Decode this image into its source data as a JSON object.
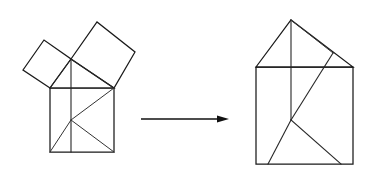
{
  "page": {
    "width": 380,
    "height": 182,
    "background_color": "#ffffff",
    "stroke_color": "#1a1a1a"
  },
  "chart_data": {
    "type": "diagram",
    "subtitle": "Squares on the legs of a right triangle rearranged into the square on the hypotenuse",
    "xlabel": "",
    "ylabel": "",
    "grid": false,
    "legend": "none",
    "xlim": [
      0,
      380
    ],
    "ylim": [
      0,
      182
    ],
    "panels": [
      {
        "name": "left-figure",
        "label": "Right triangle with squares erected on all three sides",
        "shapes": [
          {
            "name": "hypotenuse-square",
            "kind": "square",
            "points": [
              [
                50,
                88
              ],
              [
                114,
                88
              ],
              [
                114,
                152
              ],
              [
                50,
                152
              ]
            ]
          },
          {
            "name": "leg-square-small",
            "kind": "square",
            "points": [
              [
                50,
                88
              ],
              [
                23,
                70
              ],
              [
                44,
                40
              ],
              [
                71,
                59
              ]
            ]
          },
          {
            "name": "leg-square-large",
            "kind": "square",
            "points": [
              [
                71,
                59
              ],
              [
                97,
                22
              ],
              [
                135,
                52
              ],
              [
                114,
                88
              ]
            ]
          },
          {
            "name": "right-triangle",
            "kind": "triangle",
            "points": [
              [
                50,
                88
              ],
              [
                114,
                88
              ],
              [
                71,
                59
              ]
            ]
          }
        ],
        "cut_lines": [
          {
            "name": "vertical-cut",
            "from": [
              71,
              59
            ],
            "to": [
              71,
              152
            ]
          },
          {
            "name": "diagonal-cut-upper",
            "from": [
              114,
              88
            ],
            "to": [
              71,
              120
            ]
          },
          {
            "name": "diagonal-cut-lower",
            "from": [
              71,
              120
            ],
            "to": [
              50,
              152
            ]
          },
          {
            "name": "diagonal-cut-right",
            "from": [
              71,
              120
            ],
            "to": [
              114,
              152
            ]
          }
        ]
      },
      {
        "name": "right-figure",
        "label": "Reassembled house shape: square on hypotenuse plus triangular roof",
        "shapes": [
          {
            "name": "hypotenuse-square",
            "kind": "square",
            "points": [
              [
                256,
                67
              ],
              [
                353,
                67
              ],
              [
                353,
                164
              ],
              [
                256,
                164
              ]
            ]
          },
          {
            "name": "roof-triangle",
            "kind": "triangle",
            "points": [
              [
                256,
                67
              ],
              [
                291,
                20
              ],
              [
                353,
                67
              ]
            ]
          }
        ],
        "cut_lines": [
          {
            "name": "roof-vertical-cut",
            "from": [
              291,
              20
            ],
            "to": [
              291,
              120
            ]
          },
          {
            "name": "roof-right-cut",
            "from": [
              291,
              20
            ],
            "to": [
              333,
              53
            ]
          },
          {
            "name": "long-diagonal-cut",
            "from": [
              333,
              53
            ],
            "to": [
              291,
              120
            ]
          },
          {
            "name": "lower-left-cut",
            "from": [
              291,
              120
            ],
            "to": [
              268,
              164
            ]
          },
          {
            "name": "lower-right-cut",
            "from": [
              291,
              120
            ],
            "to": [
              341,
              164
            ]
          }
        ]
      }
    ],
    "connector": {
      "name": "transformation-arrow",
      "kind": "arrow",
      "from": [
        141,
        119
      ],
      "to": [
        229,
        119
      ],
      "direction": "right",
      "label": ""
    }
  }
}
